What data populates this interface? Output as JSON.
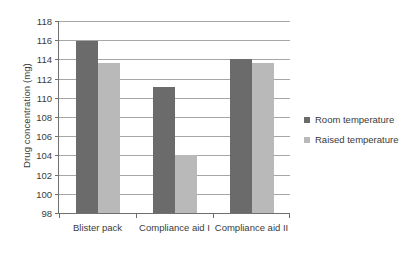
{
  "chart_data": {
    "type": "bar",
    "title": "",
    "subtitle": "",
    "xlabel": "",
    "ylabel": "Drug concentration (mg)",
    "categories": [
      "Blister pack",
      "Compliance aid I",
      "Compliance aid II"
    ],
    "series": [
      {
        "name": "Room temperature",
        "color": "#6b6b6b",
        "values": [
          115.9,
          111.1,
          114.0
        ]
      },
      {
        "name": "Raised temperature",
        "color": "#b9b9b9",
        "values": [
          113.6,
          104.0,
          113.6
        ]
      }
    ],
    "ylim": [
      98,
      118
    ],
    "ytick_step": 2,
    "yticks": [
      118,
      116,
      114,
      112,
      110,
      108,
      106,
      104,
      102,
      100,
      98
    ],
    "ytick_labels": [
      "118",
      "116",
      "114",
      "112",
      "110",
      "108",
      "106",
      "104",
      "102",
      "100",
      "98"
    ],
    "grid": true,
    "grid_axis": "y",
    "legend_position": "right",
    "legend_entries": [
      "Room temperature",
      "Raised temperature"
    ],
    "annotations": []
  }
}
